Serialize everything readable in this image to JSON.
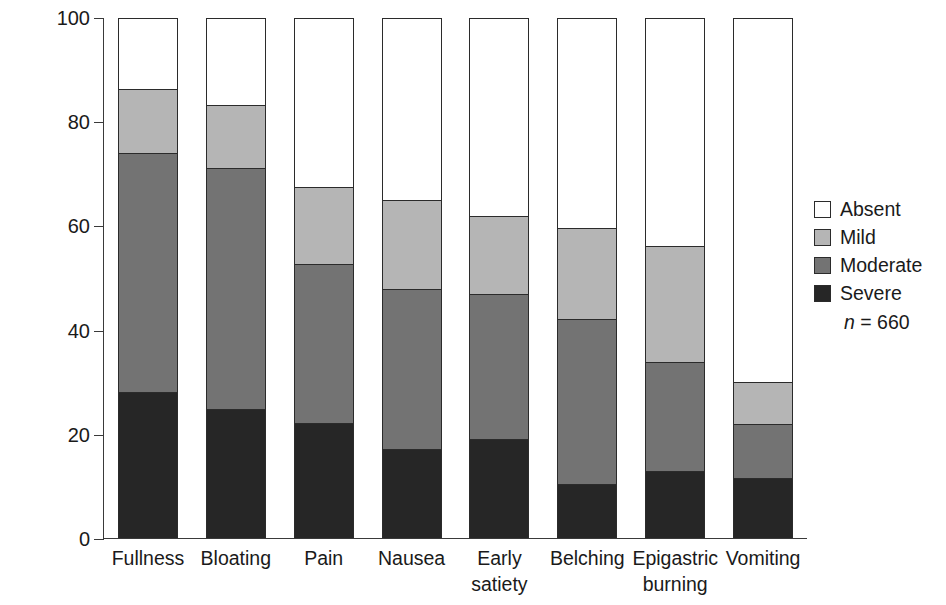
{
  "chart_data": {
    "type": "bar",
    "subtype": "stacked-vertical-100",
    "title": "",
    "xlabel": "",
    "ylabel": "Prevalence (%) of patients",
    "ylim": [
      0,
      100
    ],
    "yticks": [
      0,
      20,
      40,
      60,
      80,
      100
    ],
    "ytick_labels": [
      "0",
      "20",
      "40",
      "60",
      "80",
      "100"
    ],
    "grid": false,
    "legend_position": "right",
    "annotation": "n = 660",
    "annotation_n_label": "n",
    "annotation_n_equals": "=",
    "annotation_n_value": "660",
    "categories": [
      "Fullness",
      "Bloating",
      "Pain",
      "Nausea",
      "Early\nsatiety",
      "Belching",
      "Epigastric\nburning",
      "Vomiting"
    ],
    "series": [
      {
        "name": "Severe",
        "color": "#262626",
        "values": [
          28.3,
          25.0,
          22.3,
          17.3,
          19.2,
          10.5,
          13.0,
          11.7
        ]
      },
      {
        "name": "Moderate",
        "color": "#737373",
        "values": [
          45.7,
          46.3,
          30.5,
          30.7,
          27.8,
          31.8,
          21.0,
          10.3
        ]
      },
      {
        "name": "Mild",
        "color": "#b5b5b5",
        "values": [
          12.3,
          12.0,
          14.7,
          17.0,
          15.0,
          17.4,
          22.3,
          8.2
        ]
      },
      {
        "name": "Absent",
        "color": "#ffffff",
        "values": [
          13.7,
          16.7,
          32.5,
          35.0,
          38.0,
          40.3,
          43.7,
          69.8
        ]
      }
    ],
    "cumulative_tops": {
      "Severe": [
        28.3,
        25.0,
        22.3,
        17.3,
        19.2,
        10.5,
        13.0,
        11.7
      ],
      "Moderate": [
        74.0,
        71.3,
        52.8,
        48.0,
        47.0,
        42.3,
        34.0,
        22.0
      ],
      "Mild": [
        86.3,
        83.3,
        67.5,
        65.0,
        62.0,
        59.7,
        56.3,
        30.2
      ],
      "Absent": [
        100,
        100,
        100,
        100,
        100,
        100,
        100,
        100
      ]
    }
  },
  "legend": {
    "items": [
      {
        "label": "Absent",
        "color": "#ffffff"
      },
      {
        "label": "Mild",
        "color": "#b5b5b5"
      },
      {
        "label": "Moderate",
        "color": "#737373"
      },
      {
        "label": "Severe",
        "color": "#262626"
      }
    ]
  },
  "colors": {
    "axis": "#3a3a3a",
    "outline": "#2b2b2b",
    "text": "#1a1a1a",
    "background": "#ffffff"
  }
}
